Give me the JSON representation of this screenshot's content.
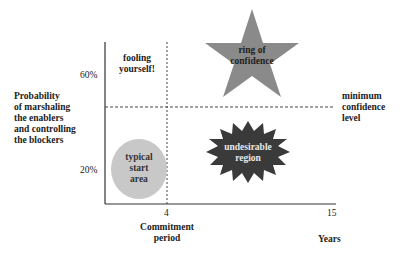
{
  "diagram": {
    "y_axis_label": [
      "Probability",
      "of marshaling",
      "the enablers",
      "and controlling",
      "the blockers"
    ],
    "y_ticks": [
      {
        "label": "60%",
        "value": 60
      },
      {
        "label": "20%",
        "value": 20
      }
    ],
    "x_ticks": [
      {
        "label": "4",
        "value": 4
      },
      {
        "label": "15",
        "value": 15
      }
    ],
    "x_axis_label": "Years",
    "commitment_label": [
      "Commitment",
      "period"
    ],
    "threshold_label": [
      "minimum",
      "confidence",
      "level"
    ],
    "regions": {
      "fooling": {
        "lines": [
          "fooling",
          "yourself!"
        ],
        "shape": "none"
      },
      "ring": {
        "lines": [
          "ring of",
          "confidence"
        ],
        "shape": "five-point-star",
        "color": "#8a8a8a"
      },
      "start": {
        "lines": [
          "typical",
          "start",
          "area"
        ],
        "shape": "circle",
        "color": "#c8c8c8"
      },
      "undesirable": {
        "lines": [
          "undesirable",
          "region"
        ],
        "shape": "starburst",
        "color": "#3a3a3a"
      }
    },
    "colors": {
      "axis": "#333333",
      "dashed": "#444444",
      "star": "#8a8a8a",
      "circle": "#c8c8c8",
      "burst": "#3a3a3a",
      "burst_text": "#e8e8e8"
    }
  }
}
